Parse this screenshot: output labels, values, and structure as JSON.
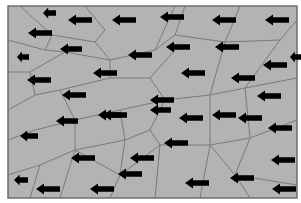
{
  "diagram": {
    "type": "voronoi-vector-field",
    "background": "#ffffff",
    "frame": {
      "x": 8,
      "y": 6,
      "width": 289,
      "height": 192,
      "fill": "#b3b3b3",
      "stroke": "#6e6e6e"
    },
    "edge_color": "#7a7a7a",
    "arrow_color": "#000000",
    "arrow_direction": "left",
    "edges": [
      [
        20,
        6,
        52,
        35
      ],
      [
        52,
        35,
        45,
        50
      ],
      [
        45,
        50,
        8,
        40
      ],
      [
        52,
        35,
        95,
        42
      ],
      [
        95,
        42,
        105,
        30
      ],
      [
        105,
        30,
        85,
        6
      ],
      [
        95,
        42,
        110,
        60
      ],
      [
        110,
        60,
        65,
        52
      ],
      [
        65,
        52,
        45,
        50
      ],
      [
        65,
        52,
        30,
        72
      ],
      [
        30,
        72,
        8,
        72
      ],
      [
        30,
        72,
        35,
        95
      ],
      [
        35,
        95,
        8,
        110
      ],
      [
        110,
        60,
        155,
        50
      ],
      [
        155,
        50,
        175,
        6
      ],
      [
        155,
        50,
        175,
        35
      ],
      [
        175,
        35,
        185,
        6
      ],
      [
        175,
        35,
        225,
        42
      ],
      [
        225,
        42,
        240,
        6
      ],
      [
        225,
        42,
        280,
        40
      ],
      [
        280,
        40,
        297,
        20
      ],
      [
        110,
        60,
        110,
        78
      ],
      [
        110,
        78,
        60,
        90
      ],
      [
        60,
        90,
        35,
        95
      ],
      [
        110,
        78,
        150,
        78
      ],
      [
        150,
        78,
        175,
        50
      ],
      [
        150,
        78,
        165,
        100
      ],
      [
        165,
        100,
        210,
        95
      ],
      [
        210,
        95,
        225,
        42
      ],
      [
        210,
        95,
        245,
        88
      ],
      [
        245,
        88,
        280,
        40
      ],
      [
        245,
        88,
        297,
        78
      ],
      [
        60,
        90,
        75,
        120
      ],
      [
        75,
        120,
        35,
        130
      ],
      [
        35,
        130,
        8,
        140
      ],
      [
        75,
        120,
        120,
        110
      ],
      [
        120,
        110,
        165,
        100
      ],
      [
        120,
        110,
        125,
        140
      ],
      [
        125,
        140,
        75,
        150
      ],
      [
        75,
        150,
        75,
        120
      ],
      [
        75,
        150,
        40,
        165
      ],
      [
        40,
        165,
        8,
        175
      ],
      [
        40,
        165,
        30,
        198
      ],
      [
        75,
        150,
        60,
        198
      ],
      [
        125,
        140,
        150,
        130
      ],
      [
        150,
        130,
        165,
        100
      ],
      [
        150,
        130,
        160,
        145
      ],
      [
        160,
        145,
        210,
        145
      ],
      [
        210,
        145,
        210,
        95
      ],
      [
        210,
        145,
        250,
        138
      ],
      [
        250,
        138,
        245,
        88
      ],
      [
        250,
        138,
        297,
        120
      ],
      [
        125,
        140,
        120,
        175
      ],
      [
        120,
        175,
        75,
        150
      ],
      [
        120,
        175,
        110,
        198
      ],
      [
        160,
        145,
        155,
        198
      ],
      [
        160,
        145,
        120,
        175
      ],
      [
        210,
        145,
        235,
        175
      ],
      [
        235,
        175,
        250,
        138
      ],
      [
        235,
        175,
        297,
        185
      ],
      [
        235,
        175,
        250,
        198
      ],
      [
        210,
        145,
        200,
        198
      ]
    ],
    "arrows": [
      {
        "x": 43,
        "y": 13,
        "len": 13
      },
      {
        "x": 68,
        "y": 20,
        "len": 24
      },
      {
        "x": 112,
        "y": 20,
        "len": 24
      },
      {
        "x": 160,
        "y": 17,
        "len": 24
      },
      {
        "x": 212,
        "y": 20,
        "len": 24
      },
      {
        "x": 265,
        "y": 20,
        "len": 24
      },
      {
        "x": 28,
        "y": 33,
        "len": 24
      },
      {
        "x": 60,
        "y": 49,
        "len": 22
      },
      {
        "x": 128,
        "y": 55,
        "len": 24
      },
      {
        "x": 166,
        "y": 47,
        "len": 24
      },
      {
        "x": 215,
        "y": 47,
        "len": 24
      },
      {
        "x": 290,
        "y": 57,
        "len": 12
      },
      {
        "x": 17,
        "y": 57,
        "len": 12
      },
      {
        "x": 27,
        "y": 80,
        "len": 24
      },
      {
        "x": 62,
        "y": 95,
        "len": 24
      },
      {
        "x": 93,
        "y": 73,
        "len": 24
      },
      {
        "x": 181,
        "y": 73,
        "len": 24
      },
      {
        "x": 263,
        "y": 65,
        "len": 24
      },
      {
        "x": 231,
        "y": 78,
        "len": 24
      },
      {
        "x": 150,
        "y": 100,
        "len": 24
      },
      {
        "x": 212,
        "y": 115,
        "len": 24
      },
      {
        "x": 257,
        "y": 96,
        "len": 24
      },
      {
        "x": 103,
        "y": 115,
        "len": 24
      },
      {
        "x": 150,
        "y": 110,
        "len": 21
      },
      {
        "x": 179,
        "y": 118,
        "len": 24
      },
      {
        "x": 20,
        "y": 136,
        "len": 18
      },
      {
        "x": 56,
        "y": 121,
        "len": 22
      },
      {
        "x": 98,
        "y": 115,
        "len": 23
      },
      {
        "x": 164,
        "y": 143,
        "len": 24
      },
      {
        "x": 268,
        "y": 128,
        "len": 24
      },
      {
        "x": 238,
        "y": 118,
        "len": 24
      },
      {
        "x": 71,
        "y": 158,
        "len": 24
      },
      {
        "x": 118,
        "y": 174,
        "len": 24
      },
      {
        "x": 185,
        "y": 183,
        "len": 24
      },
      {
        "x": 230,
        "y": 178,
        "len": 24
      },
      {
        "x": 271,
        "y": 160,
        "len": 24
      },
      {
        "x": 14,
        "y": 180,
        "len": 14
      },
      {
        "x": 36,
        "y": 189,
        "len": 24
      },
      {
        "x": 90,
        "y": 189,
        "len": 24
      },
      {
        "x": 130,
        "y": 158,
        "len": 24
      },
      {
        "x": 272,
        "y": 189,
        "len": 24
      }
    ]
  }
}
